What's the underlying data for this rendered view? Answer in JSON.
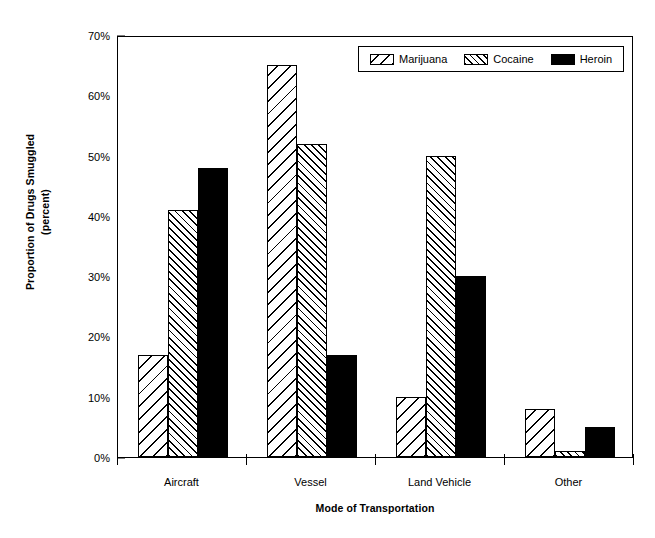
{
  "chart_data": {
    "type": "bar",
    "title": "",
    "xlabel": "Mode of Transportation",
    "ylabel": "Proportion of Drugs Smuggled (percent)",
    "ylabel_line1": "Proportion of Drugs Smuggled",
    "ylabel_line2": "(percent)",
    "categories": [
      "Aircraft",
      "Vessel",
      "Land Vehicle",
      "Other"
    ],
    "series": [
      {
        "name": "Marijuana",
        "pattern": "backslash-hatch",
        "values": [
          17,
          65,
          10,
          8
        ]
      },
      {
        "name": "Cocaine",
        "pattern": "forwardslash-hatch",
        "values": [
          41,
          52,
          50,
          1
        ]
      },
      {
        "name": "Heroin",
        "pattern": "solid-black",
        "values": [
          48,
          17,
          30,
          5
        ]
      }
    ],
    "ylim": [
      0,
      70
    ],
    "ytick_values": [
      0,
      10,
      20,
      30,
      40,
      50,
      60,
      70
    ],
    "ytick_labels": [
      "0%",
      "10%",
      "20%",
      "30%",
      "40%",
      "50%",
      "60%",
      "70%"
    ],
    "grid": false,
    "legend_position": "top-right-inside",
    "colors": {
      "fill": "#ffffff",
      "line": "#000000",
      "heroin": "#000000"
    }
  },
  "legend": {
    "items": [
      {
        "label": "Marijuana"
      },
      {
        "label": "Cocaine"
      },
      {
        "label": "Heroin"
      }
    ]
  }
}
